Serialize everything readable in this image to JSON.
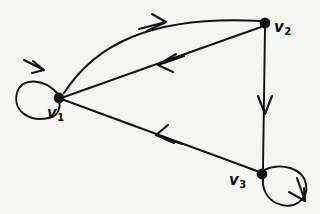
{
  "figure": {
    "type": "directed-graph-diagram",
    "background_color": "#f5f5f4",
    "stroke_color": "#111111",
    "width": 320,
    "height": 214
  },
  "nodes": [
    {
      "id": "v1",
      "label": "v",
      "subscript": "1",
      "x": 59,
      "y": 98,
      "radius": 5
    },
    {
      "id": "v2",
      "label": "v",
      "subscript": "2",
      "x": 265,
      "y": 23,
      "radius": 5
    },
    {
      "id": "v3",
      "label": "v",
      "subscript": "3",
      "x": 262,
      "y": 174,
      "radius": 5
    }
  ],
  "edges": [
    {
      "id": "e-v1-v2-curve",
      "from": "v1",
      "to": "v2",
      "shape": "curved",
      "direction": "v1 to v2",
      "arrow_at": {
        "x": 158,
        "y": 23
      }
    },
    {
      "id": "e-v2-v1-straight",
      "from": "v2",
      "to": "v1",
      "shape": "straight",
      "direction": "v2 to v1",
      "arrow_at": {
        "x": 165,
        "y": 62
      }
    },
    {
      "id": "e-v2-v3",
      "from": "v2",
      "to": "v3",
      "shape": "straight",
      "direction": "v2 to v3",
      "arrow_at": {
        "x": 266,
        "y": 108
      }
    },
    {
      "id": "e-v3-v1",
      "from": "v3",
      "to": "v1",
      "shape": "straight",
      "direction": "v3 to v1",
      "arrow_at": {
        "x": 163,
        "y": 138
      }
    },
    {
      "id": "loop-v1",
      "from": "v1",
      "to": "v1",
      "shape": "self-loop",
      "direction": "v1 to v1",
      "arrow_at": {
        "x": 36,
        "y": 65
      }
    },
    {
      "id": "loop-v3",
      "from": "v3",
      "to": "v3",
      "shape": "self-loop",
      "direction": "v3 to v3",
      "arrow_at": {
        "x": 300,
        "y": 197
      }
    }
  ]
}
